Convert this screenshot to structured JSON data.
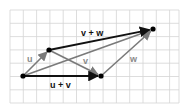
{
  "diagram": {
    "type": "vector-addition",
    "grid": {
      "x0": 10,
      "y0": 10,
      "x1": 179,
      "y1": 103,
      "spacing": 13.3,
      "color": "#d4d4d4"
    },
    "points": {
      "A": {
        "x": 23,
        "y": 76
      },
      "B": {
        "x": 49,
        "y": 50
      },
      "C": {
        "x": 101,
        "y": 76
      },
      "D": {
        "x": 153,
        "y": 29
      }
    },
    "vectors": [
      {
        "id": "u",
        "from": "A",
        "to": "B",
        "color": "#7a7a7a"
      },
      {
        "id": "v",
        "from": "B",
        "to": "C",
        "color": "#7a7a7a"
      },
      {
        "id": "w",
        "from": "C",
        "to": "D",
        "color": "#7a7a7a"
      },
      {
        "id": "u_plus_v",
        "from": "A",
        "to": "C",
        "color": "#111111"
      },
      {
        "id": "v_plus_w",
        "from": "B",
        "to": "D",
        "color": "#111111"
      },
      {
        "id": "u_plus_v_plus_w",
        "from": "A",
        "to": "D",
        "color": "#7a7a7a"
      }
    ],
    "labels": {
      "u": "u",
      "v": "v",
      "w": "w",
      "u_plus_v": "u + v",
      "v_plus_w": "v + w"
    },
    "label_colors": {
      "gray": "#8a8a8a",
      "black": "#111111"
    }
  }
}
